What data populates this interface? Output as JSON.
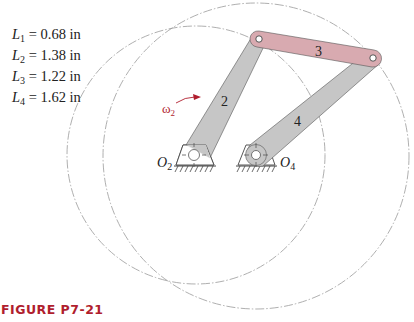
{
  "lengths": [
    {
      "symbol": "L",
      "sub": "1",
      "value": "= 0.68 in"
    },
    {
      "symbol": "L",
      "sub": "2",
      "value": "= 1.38 in"
    },
    {
      "symbol": "L",
      "sub": "3",
      "value": "= 1.22 in"
    },
    {
      "symbol": "L",
      "sub": "4",
      "value": "= 1.62 in"
    }
  ],
  "labels": {
    "link2": "2",
    "link3": "3",
    "link4": "4",
    "omega": "ω",
    "omega_sub": "2",
    "o2": "O",
    "o2_sub": "2",
    "o4": "O",
    "o4_sub": "4"
  },
  "caption": "FIGURE P7-21",
  "colors": {
    "link_gray": "#c6c6c6",
    "link3_pink": "#d8aab0",
    "accent_red": "#b01e2e",
    "circle_line": "#9a9a9a"
  }
}
